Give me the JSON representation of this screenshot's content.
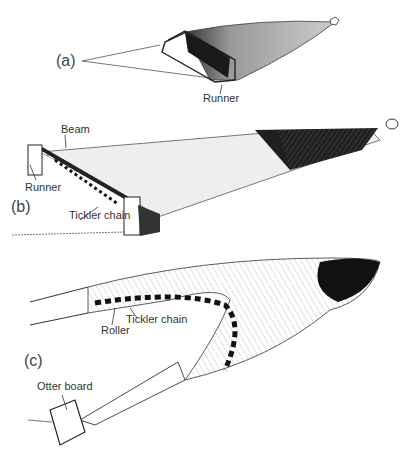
{
  "panels": [
    {
      "id": "a",
      "label": "(a)",
      "annotations": [
        {
          "text": "Runner"
        }
      ]
    },
    {
      "id": "b",
      "label": "(b)",
      "annotations": [
        {
          "text": "Beam"
        },
        {
          "text": "Runner"
        },
        {
          "text": "Tickler chain"
        }
      ]
    },
    {
      "id": "c",
      "label": "(c)",
      "annotations": [
        {
          "text": "Roller"
        },
        {
          "text": "Tickler chain"
        },
        {
          "text": "Otter board"
        }
      ]
    }
  ],
  "colors": {
    "ink": "#222222",
    "net_dark": "#1a1a1a",
    "net_light": "#e6e6e6",
    "background": "#ffffff"
  }
}
